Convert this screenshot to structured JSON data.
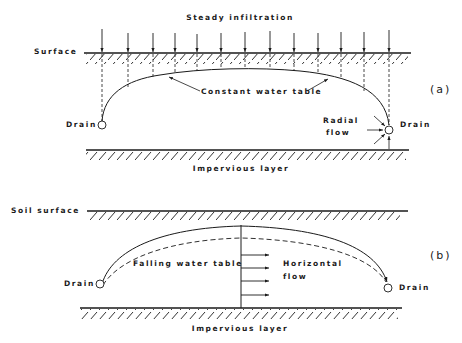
{
  "panel_a": {
    "tag": "(a)",
    "title": "Steady infiltration",
    "surface_label": "Surface",
    "water_table_label": "Constant water table",
    "drain_left_label": "Drain",
    "drain_right_label": "Drain",
    "radial_flow_label_line1": "Radial",
    "radial_flow_label_line2": "flow",
    "impervious_label": "Impervious layer"
  },
  "panel_b": {
    "tag": "(b)",
    "surface_label": "Soil surface",
    "water_table_label": "Falling water table",
    "horizontal_flow_label_line1": "Horizontal",
    "horizontal_flow_label_line2": "flow",
    "drain_left_label": "Drain",
    "drain_right_label": "Drain",
    "impervious_label": "Impervious layer"
  },
  "colors": {
    "ink": "#1a1a1a",
    "background": "#ffffff"
  }
}
